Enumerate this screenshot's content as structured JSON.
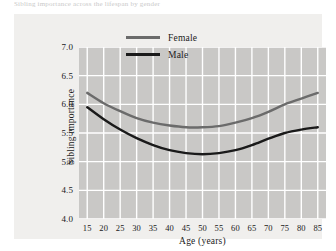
{
  "figure": {
    "top_caption": "Sibling importance across the lifespan by gender",
    "panel_background": "#f0efed",
    "plot_background": "#c9c8c6",
    "grid_color": "#ffffff"
  },
  "chart_data": {
    "type": "line",
    "title": "",
    "xlabel": "Age (years)",
    "ylabel": "Sibling importance",
    "xlim": [
      12.5,
      87.5
    ],
    "ylim": [
      4.0,
      7.0
    ],
    "grid": true,
    "legend_position": "top-center",
    "xticks": [
      15,
      20,
      25,
      30,
      35,
      40,
      45,
      50,
      55,
      60,
      65,
      70,
      75,
      80,
      85
    ],
    "yticks": [
      "7.0",
      "6.5",
      "6.0",
      "5.5",
      "5.0",
      "4.5",
      "4.0"
    ],
    "x": [
      15,
      20,
      25,
      30,
      35,
      40,
      45,
      50,
      55,
      60,
      65,
      70,
      75,
      80,
      85
    ],
    "series": [
      {
        "name": "Female",
        "color": "#6b6b6b",
        "values": [
          6.2,
          6.02,
          5.88,
          5.76,
          5.68,
          5.63,
          5.6,
          5.6,
          5.62,
          5.68,
          5.76,
          5.87,
          6.0,
          6.1,
          6.2
        ]
      },
      {
        "name": "Male",
        "color": "#1a1a1a",
        "values": [
          5.95,
          5.74,
          5.56,
          5.41,
          5.29,
          5.2,
          5.15,
          5.13,
          5.15,
          5.2,
          5.29,
          5.4,
          5.5,
          5.56,
          5.6
        ]
      }
    ]
  },
  "legend": {
    "items": [
      {
        "label": "Female",
        "color": "#6b6b6b"
      },
      {
        "label": "Male",
        "color": "#1a1a1a"
      }
    ]
  }
}
